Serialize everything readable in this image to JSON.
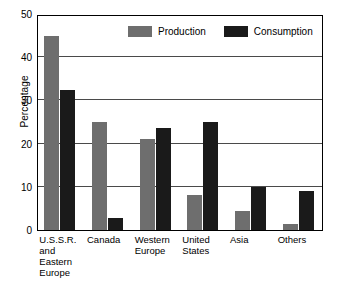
{
  "chart_data": {
    "type": "bar",
    "title": "",
    "xlabel": "",
    "ylabel": "Percentage",
    "ylim": [
      0,
      50
    ],
    "yticks": [
      0,
      10,
      20,
      30,
      40,
      50
    ],
    "ytick_labels": [
      "0",
      "10",
      "20",
      "30",
      "40",
      "50"
    ],
    "grid": "horizontal gridlines at 10, 20, 30, 40",
    "legend_position": "inside top-center",
    "categories": [
      "U.S.S.R.\nand\nEastern\nEurope",
      "Canada",
      "Western\nEurope",
      "United\nStates",
      "Asia",
      "Others"
    ],
    "series": [
      {
        "name": "Production",
        "color": "#6e6e6e",
        "values": [
          45,
          25,
          21,
          8,
          4.5,
          1.5
        ]
      },
      {
        "name": "Consumption",
        "color": "#1a1a1a",
        "values": [
          32.5,
          2.8,
          23.5,
          25,
          10,
          9
        ]
      }
    ]
  },
  "axis": {
    "y_title": "Percentage"
  },
  "legend": {
    "items": [
      {
        "label": "Production",
        "color": "#6e6e6e"
      },
      {
        "label": "Consumption",
        "color": "#1a1a1a"
      }
    ]
  }
}
